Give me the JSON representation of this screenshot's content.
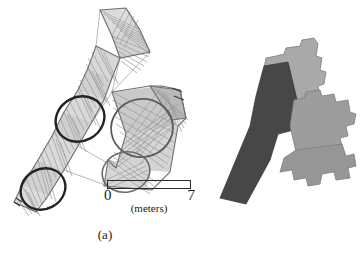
{
  "figure": {
    "background_color": "#ffffff",
    "width": 364,
    "height": 253,
    "panels": [
      {
        "id": "a",
        "caption": "(a)",
        "description": "triangulated-wireframe-mesh-map"
      },
      {
        "id": "b",
        "caption": "(b)",
        "description": "filled-polygon-footprint-map"
      }
    ]
  },
  "scale_bar": {
    "label_left": "0",
    "label_right": "7",
    "units_label": "(meters)",
    "segment_count": 4,
    "segments": [
      "light",
      "dark",
      "light",
      "dark"
    ],
    "colors": {
      "light": "#d6d6d6",
      "dark": "#141414",
      "outline": "#2a2a2a"
    },
    "range_min": 0,
    "range_max": 7
  },
  "panel_a": {
    "caption": "(a)",
    "stroke_color": "#8c8c8c",
    "highlight_stroke_color": "#232323",
    "fill_light": "#d9d9d9",
    "fill_mid": "#b3b3b3",
    "circle_count": 3,
    "annotation_circles": [
      {
        "name": "circle-upper-left",
        "cx": 80,
        "cy": 119,
        "rx": 25,
        "ry": 22,
        "rot": -28
      },
      {
        "name": "circle-lower-left",
        "cx": 43,
        "cy": 189,
        "rx": 23,
        "ry": 20,
        "rot": -28
      },
      {
        "name": "circle-right-large",
        "cx": 142,
        "cy": 128,
        "rx": 30,
        "ry": 28,
        "rot": -10
      }
    ]
  },
  "panel_b": {
    "caption": "(b)",
    "colors": {
      "dark_region": "#474747",
      "light_region_upper": "#a9a9a9",
      "light_region_mid": "#9d9d9d",
      "light_region_lower": "#969696",
      "outline": "#6d6d6d"
    },
    "region_count": 4,
    "regions": [
      {
        "name": "region-dark-strip",
        "shade": "dark"
      },
      {
        "name": "region-light-upper",
        "shade": "light"
      },
      {
        "name": "region-light-mid",
        "shade": "light"
      },
      {
        "name": "region-light-lower",
        "shade": "light"
      }
    ]
  }
}
